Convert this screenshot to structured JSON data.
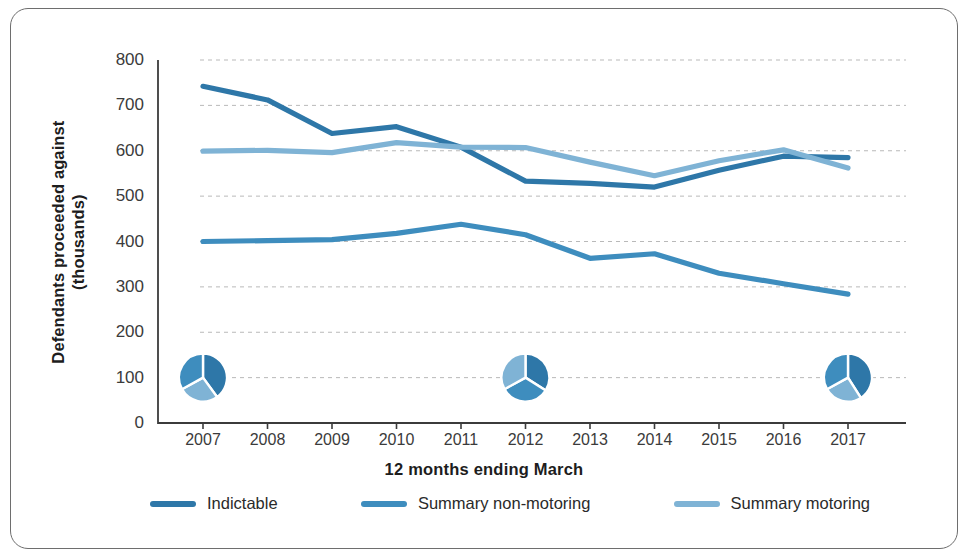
{
  "chart_data": {
    "type": "line",
    "title": "",
    "xlabel": "12 months ending March",
    "ylabel": "Defendants proceeded against (thousands)",
    "ylabel_line1": "Defendants proceeded against",
    "ylabel_line2": "(thousands)",
    "categories": [
      "2007",
      "2008",
      "2009",
      "2010",
      "2011",
      "2012",
      "2013",
      "2014",
      "2015",
      "2016",
      "2017"
    ],
    "x": [
      2007,
      2008,
      2009,
      2010,
      2011,
      2012,
      2013,
      2014,
      2015,
      2016,
      2017
    ],
    "ylim": [
      0,
      800
    ],
    "yticks": [
      0,
      100,
      200,
      300,
      400,
      500,
      600,
      700,
      800
    ],
    "ytick_labels": [
      "0",
      "100",
      "200",
      "300",
      "400",
      "500",
      "600",
      "700",
      "800"
    ],
    "grid": true,
    "grid_style": "dashed-horizontal",
    "legend_position": "bottom",
    "series": [
      {
        "name": "Indictable",
        "color": "#2e77a8",
        "values": [
          742,
          712,
          638,
          653,
          608,
          533,
          528,
          520,
          557,
          588,
          585
        ]
      },
      {
        "name": "Summary non-motoring",
        "color": "#3e8dbe",
        "values": [
          400,
          402,
          404,
          418,
          438,
          415,
          363,
          373,
          330,
          307,
          284
        ]
      },
      {
        "name": "Summary motoring",
        "color": "#7fb3d5",
        "values": [
          599,
          601,
          596,
          618,
          608,
          607,
          575,
          545,
          578,
          602,
          562
        ]
      }
    ],
    "inset_pies": [
      {
        "name": "pie-2007",
        "at_x": 2007,
        "at_y": 100,
        "slices": [
          {
            "label": "Indictable",
            "color": "#2e77a8",
            "fraction": 0.4
          },
          {
            "label": "Summary motoring",
            "color": "#7fb3d5",
            "fraction": 0.27
          },
          {
            "label": "Summary non-motoring",
            "color": "#3e8dbe",
            "fraction": 0.33
          }
        ]
      },
      {
        "name": "pie-2012",
        "at_x": 2012,
        "at_y": 100,
        "slices": [
          {
            "label": "Indictable",
            "color": "#2e77a8",
            "fraction": 0.34
          },
          {
            "label": "Summary motoring",
            "color": "#3e8dbe",
            "fraction": 0.33
          },
          {
            "label": "Summary non-motoring",
            "color": "#7fb3d5",
            "fraction": 0.33
          }
        ]
      },
      {
        "name": "pie-2017",
        "at_x": 2017,
        "at_y": 100,
        "slices": [
          {
            "label": "Indictable",
            "color": "#2e77a8",
            "fraction": 0.41
          },
          {
            "label": "Summary motoring",
            "color": "#7fb3d5",
            "fraction": 0.26
          },
          {
            "label": "Summary non-motoring",
            "color": "#3e8dbe",
            "fraction": 0.33
          }
        ]
      }
    ]
  },
  "axes": {
    "axis_color": "#3b3b3b",
    "grid_color": "#b9b9b9"
  },
  "legend": {
    "items": [
      {
        "label": "Indictable",
        "color": "#2e77a8"
      },
      {
        "label": "Summary non-motoring",
        "color": "#3e8dbe"
      },
      {
        "label": "Summary motoring",
        "color": "#7fb3d5"
      }
    ]
  },
  "frame": {
    "border_color": "#6e6e6e",
    "background": "#ffffff"
  }
}
